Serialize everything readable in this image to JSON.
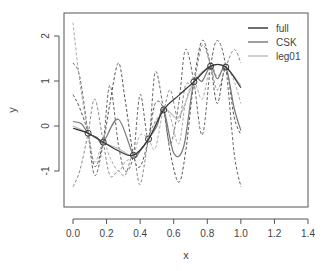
{
  "chart_data": {
    "type": "line",
    "title": "",
    "xlabel": "x",
    "ylabel": "y",
    "xlim": [
      0.0,
      1.4
    ],
    "ylim": [
      -1.5,
      2.4
    ],
    "xticks": [
      "0.0",
      "0.2",
      "0.4",
      "0.6",
      "0.8",
      "1.0",
      "1.2",
      "1.4"
    ],
    "yticks": [
      "-1",
      "0",
      "1",
      "2"
    ],
    "grid": false,
    "legend_position": "top-right",
    "legend": [
      {
        "label": "full",
        "color": "#333333"
      },
      {
        "label": "CSK",
        "color": "#777777"
      },
      {
        "label": "leg01",
        "color": "#bbbbbb"
      }
    ],
    "points": {
      "x": [
        0.09,
        0.18,
        0.36,
        0.45,
        0.54,
        0.72,
        0.82,
        0.91
      ],
      "y": [
        -0.16,
        -0.36,
        -0.65,
        -0.29,
        0.36,
        0.98,
        1.33,
        1.31
      ]
    },
    "series": [
      {
        "name": "full",
        "color": "#333333",
        "style": "solid",
        "x": [
          0.0,
          0.09,
          0.18,
          0.27,
          0.36,
          0.45,
          0.54,
          0.63,
          0.72,
          0.82,
          0.91,
          1.0
        ],
        "y": [
          -0.05,
          -0.16,
          -0.36,
          -0.55,
          -0.65,
          -0.29,
          0.36,
          0.68,
          0.98,
          1.33,
          1.31,
          0.85
        ]
      },
      {
        "name": "CSK",
        "color": "#777777",
        "style": "solid",
        "x": [
          0.0,
          0.05,
          0.09,
          0.14,
          0.18,
          0.27,
          0.36,
          0.4,
          0.45,
          0.5,
          0.54,
          0.6,
          0.66,
          0.72,
          0.77,
          0.82,
          0.86,
          0.91,
          0.96,
          1.0
        ],
        "y": [
          0.1,
          0.05,
          -0.16,
          -0.25,
          -0.36,
          0.15,
          -0.65,
          -0.55,
          -0.29,
          0.0,
          0.36,
          -0.6,
          -0.45,
          0.98,
          1.0,
          1.33,
          1.05,
          1.31,
          0.4,
          -0.1
        ]
      },
      {
        "name": "leg01",
        "color": "#bbbbbb",
        "style": "solid",
        "x": [
          0.0,
          0.09,
          0.18,
          0.27,
          0.36,
          0.45,
          0.54,
          0.63,
          0.72,
          0.82,
          0.91,
          1.0
        ],
        "y": [
          0.0,
          -0.16,
          -0.36,
          -0.5,
          -0.65,
          -0.29,
          0.36,
          0.2,
          0.98,
          1.33,
          1.31,
          0.9
        ]
      }
    ],
    "dashed_curves": [
      {
        "color": "#555555",
        "x": [
          0.0,
          0.04,
          0.09,
          0.13,
          0.18,
          0.22,
          0.27,
          0.31,
          0.36,
          0.4,
          0.45,
          0.49,
          0.54,
          0.58,
          0.63,
          0.67,
          0.72,
          0.77,
          0.82,
          0.86,
          0.91,
          0.96,
          1.0
        ],
        "y": [
          0.7,
          0.4,
          -0.16,
          -0.9,
          -0.36,
          0.5,
          1.4,
          0.6,
          -0.65,
          -0.9,
          -0.29,
          0.5,
          0.36,
          -0.6,
          -1.25,
          -0.6,
          0.98,
          1.9,
          1.33,
          0.5,
          1.31,
          0.2,
          -0.2
        ]
      },
      {
        "color": "#666666",
        "x": [
          0.0,
          0.04,
          0.09,
          0.13,
          0.18,
          0.22,
          0.27,
          0.31,
          0.36,
          0.4,
          0.45,
          0.49,
          0.54,
          0.58,
          0.63,
          0.67,
          0.72,
          0.77,
          0.82,
          0.86,
          0.91,
          0.96,
          1.0
        ],
        "y": [
          1.4,
          1.1,
          -0.16,
          -1.1,
          -0.36,
          0.9,
          -0.4,
          -1.0,
          -0.65,
          0.7,
          -0.29,
          1.2,
          0.36,
          -0.4,
          0.5,
          1.7,
          0.98,
          -0.2,
          1.33,
          1.9,
          1.31,
          -0.6,
          -1.35
        ]
      },
      {
        "color": "#888888",
        "x": [
          0.0,
          0.04,
          0.09,
          0.13,
          0.18,
          0.22,
          0.27,
          0.31,
          0.36,
          0.4,
          0.45,
          0.49,
          0.54,
          0.58,
          0.63,
          0.67,
          0.72,
          0.77,
          0.82,
          0.86,
          0.91,
          0.96,
          1.0
        ],
        "y": [
          -1.35,
          -1.0,
          -0.16,
          0.6,
          -0.36,
          -1.1,
          -1.0,
          -1.1,
          -0.65,
          -1.3,
          -0.29,
          0.1,
          0.36,
          0.8,
          0.1,
          0.9,
          0.98,
          1.8,
          1.33,
          0.8,
          1.31,
          1.7,
          1.4
        ]
      },
      {
        "color": "#aaaaaa",
        "x": [
          0.0,
          0.04,
          0.09,
          0.13,
          0.18,
          0.22,
          0.27,
          0.31,
          0.36,
          0.4,
          0.45,
          0.49,
          0.54,
          0.58,
          0.63,
          0.67,
          0.72,
          0.77,
          0.82,
          0.86,
          0.91,
          0.96,
          1.0
        ],
        "y": [
          2.3,
          1.0,
          -0.16,
          -0.8,
          -0.36,
          -0.7,
          -1.0,
          -0.8,
          -0.65,
          -0.2,
          -0.29,
          -0.5,
          0.36,
          0.2,
          -0.4,
          0.5,
          0.98,
          0.6,
          1.33,
          1.1,
          1.31,
          1.0,
          0.5
        ]
      }
    ]
  }
}
